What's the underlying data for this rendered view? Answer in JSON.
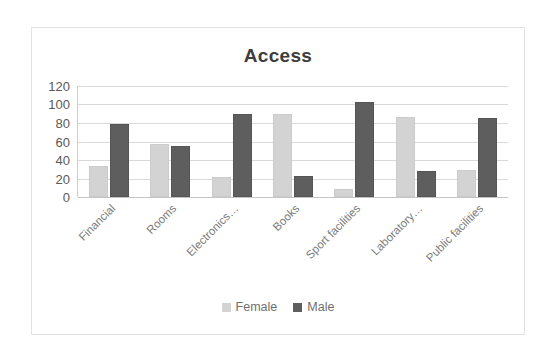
{
  "chart_data": {
    "type": "bar",
    "title": "Access",
    "xlabel": "",
    "ylabel": "",
    "ylim": [
      0,
      120
    ],
    "yticks": [
      0,
      20,
      40,
      60,
      80,
      100,
      120
    ],
    "grid": true,
    "legend_position": "bottom",
    "categories": [
      "Financial",
      "Rooms",
      "Electronics…",
      "Books",
      "Sport facilities",
      "Laboratory…",
      "Public facilities"
    ],
    "series": [
      {
        "name": "Female",
        "color": "#d3d3d3",
        "values": [
          33,
          57,
          22,
          90,
          9,
          86,
          29
        ]
      },
      {
        "name": "Male",
        "color": "#5e5e5e",
        "values": [
          79,
          55,
          90,
          23,
          103,
          28,
          85
        ]
      }
    ]
  },
  "legend": {
    "items": [
      {
        "label": "Female",
        "swatch": "female-swatch"
      },
      {
        "label": "Male",
        "swatch": "male-swatch"
      }
    ]
  }
}
